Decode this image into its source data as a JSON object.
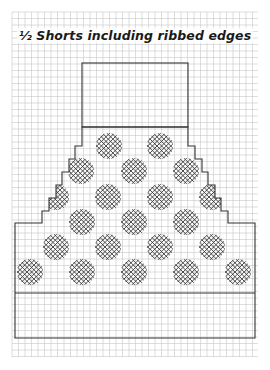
{
  "title": "½ Shorts including ribbed edges",
  "colors": {
    "background": "#ffffff",
    "grid": "#c8c8c8",
    "outline": "#333333",
    "crosshatch": "#3a3a3a"
  },
  "grid": {
    "x0": 12,
    "y0": 12,
    "x1": 258,
    "y1": 357,
    "step": 6.5
  },
  "pattern": {
    "waistband": {
      "x": 82,
      "y": 63,
      "width": 106,
      "height": 64
    },
    "body_outline": [
      [
        82,
        127
      ],
      [
        82,
        146
      ],
      [
        75,
        146
      ],
      [
        75,
        159
      ],
      [
        69,
        159
      ],
      [
        69,
        172
      ],
      [
        62,
        172
      ],
      [
        62,
        185
      ],
      [
        56,
        185
      ],
      [
        56,
        198
      ],
      [
        49,
        198
      ],
      [
        49,
        211
      ],
      [
        42,
        211
      ],
      [
        42,
        223
      ],
      [
        15,
        223
      ],
      [
        15,
        338
      ],
      [
        255,
        338
      ],
      [
        255,
        223
      ],
      [
        228,
        223
      ],
      [
        228,
        211
      ],
      [
        221,
        211
      ],
      [
        221,
        198
      ],
      [
        215,
        198
      ],
      [
        215,
        185
      ],
      [
        208,
        185
      ],
      [
        208,
        172
      ],
      [
        202,
        172
      ],
      [
        202,
        159
      ],
      [
        195,
        159
      ],
      [
        195,
        146
      ],
      [
        188,
        146
      ],
      [
        188,
        127
      ]
    ],
    "ribbed_edge": {
      "y": 293,
      "x_start": 15,
      "x_end": 255
    },
    "dot_radius": 13,
    "dots": [
      {
        "cx": 109,
        "cy": 146
      },
      {
        "cx": 160,
        "cy": 146
      },
      {
        "cx": 81,
        "cy": 171
      },
      {
        "cx": 134,
        "cy": 171
      },
      {
        "cx": 186,
        "cy": 171
      },
      {
        "cx": 56,
        "cy": 197
      },
      {
        "cx": 108,
        "cy": 197
      },
      {
        "cx": 160,
        "cy": 197
      },
      {
        "cx": 212,
        "cy": 197
      },
      {
        "cx": 82,
        "cy": 222
      },
      {
        "cx": 134,
        "cy": 222
      },
      {
        "cx": 186,
        "cy": 222
      },
      {
        "cx": 56,
        "cy": 247
      },
      {
        "cx": 108,
        "cy": 247
      },
      {
        "cx": 160,
        "cy": 247
      },
      {
        "cx": 212,
        "cy": 247
      },
      {
        "cx": 30,
        "cy": 272
      },
      {
        "cx": 82,
        "cy": 272
      },
      {
        "cx": 134,
        "cy": 272
      },
      {
        "cx": 186,
        "cy": 272
      },
      {
        "cx": 238,
        "cy": 272
      }
    ]
  }
}
